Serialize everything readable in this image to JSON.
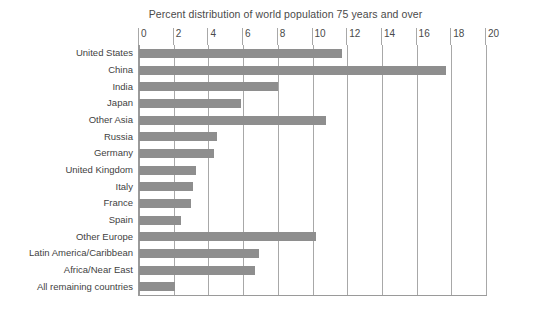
{
  "chart_data": {
    "type": "bar",
    "orientation": "horizontal",
    "title": "Percent distribution of world population 75 years and over",
    "xlabel": "",
    "ylabel": "",
    "xlim": [
      0,
      20
    ],
    "xticks": [
      0,
      2,
      4,
      6,
      8,
      10,
      12,
      14,
      16,
      18,
      20
    ],
    "tick_labels": [
      "0",
      "2",
      "4",
      "6",
      "8",
      "10",
      "12",
      "14",
      "16",
      "18",
      "20"
    ],
    "grid": "vertical",
    "legend": "none",
    "bar_color": "#8e8e8e",
    "axis_color": "#9a9a9a",
    "categories": [
      "United States",
      "China",
      "India",
      "Japan",
      "Other Asia",
      "Russia",
      "Germany",
      "United Kingdom",
      "Italy",
      "France",
      "Spain",
      "Other Europe",
      "Latin America/Caribbean",
      "Africa/Near East",
      "All remaining countries"
    ],
    "values": [
      11.7,
      17.7,
      8.0,
      5.9,
      10.8,
      4.5,
      4.3,
      3.3,
      3.1,
      3.0,
      2.4,
      10.2,
      6.9,
      6.7,
      2.1
    ]
  }
}
